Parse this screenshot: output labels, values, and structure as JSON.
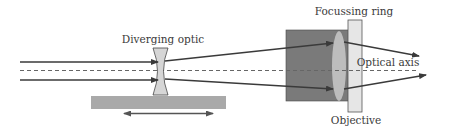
{
  "diagram": {
    "labels": {
      "diverging_optic": "Diverging optic",
      "focussing_ring": "Focussing ring",
      "optical_axis": "Optical axis",
      "objective": "Objective"
    },
    "components": [
      {
        "name": "incoming-beam",
        "type": "parallel rays",
        "count": 2
      },
      {
        "name": "diverging-optic",
        "type": "concave lens"
      },
      {
        "name": "translation-stage",
        "type": "movable stage with double-headed arrow"
      },
      {
        "name": "objective",
        "type": "lens housing with convex lens"
      },
      {
        "name": "focussing-ring",
        "type": "ring"
      },
      {
        "name": "optical-axis",
        "type": "dashed line"
      }
    ],
    "colors": {
      "ray": "#3a3a3a",
      "axis": "#666666",
      "stage": "#a9a9a9",
      "lens_fill": "#d6d6d6",
      "objective_body": "#7a7a7a",
      "objective_lens": "#bdbdbd",
      "ring": "#e6e6e6"
    }
  }
}
